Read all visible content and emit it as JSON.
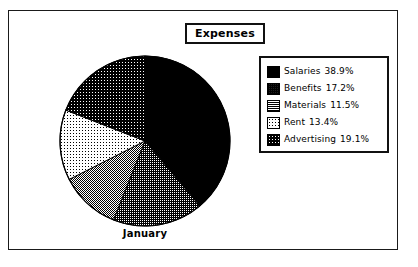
{
  "chart_data": {
    "type": "pie",
    "title": "Expenses",
    "category_label": "January",
    "xlabel": "",
    "ylabel": "",
    "legend_position": "right",
    "grid": false,
    "categories": [
      "Salaries",
      "Benefits",
      "Materials",
      "Rent",
      "Advertising"
    ],
    "values": [
      38.9,
      17.2,
      11.5,
      13.4,
      19.1
    ],
    "value_labels": [
      "38.9%",
      "17.2%",
      "11.5%",
      "13.4%",
      "19.1%"
    ],
    "start_angle_deg": 0,
    "direction": "clockwise",
    "slice_fills": [
      "solid-black",
      "dense-stipple",
      "medium-stipple",
      "light-stipple",
      "dark-stipple"
    ]
  },
  "frame": {
    "border_color": "#1a1a1a",
    "background": "#ffffff"
  },
  "title": {
    "text": "Expenses"
  },
  "pie": {
    "category_label": "January",
    "outline_color": "#000000",
    "slices": [
      {
        "name": "Salaries",
        "value": 38.9,
        "fill": "solid-black"
      },
      {
        "name": "Benefits",
        "value": 17.2,
        "fill": "dense-stipple"
      },
      {
        "name": "Materials",
        "value": 11.5,
        "fill": "medium-stipple"
      },
      {
        "name": "Rent",
        "value": 13.4,
        "fill": "light-stipple"
      },
      {
        "name": "Advertising",
        "value": 19.1,
        "fill": "dark-stipple"
      }
    ]
  },
  "legend": {
    "items": [
      {
        "label": "Salaries",
        "percent": "38.9%",
        "fill": "solid-black"
      },
      {
        "label": "Benefits",
        "percent": "17.2%",
        "fill": "dense-stipple"
      },
      {
        "label": "Materials",
        "percent": "11.5%",
        "fill": "medium-stipple"
      },
      {
        "label": "Rent",
        "percent": "13.4%",
        "fill": "light-stipple"
      },
      {
        "label": "Advertising",
        "percent": "19.1%",
        "fill": "dark-stipple"
      }
    ]
  }
}
